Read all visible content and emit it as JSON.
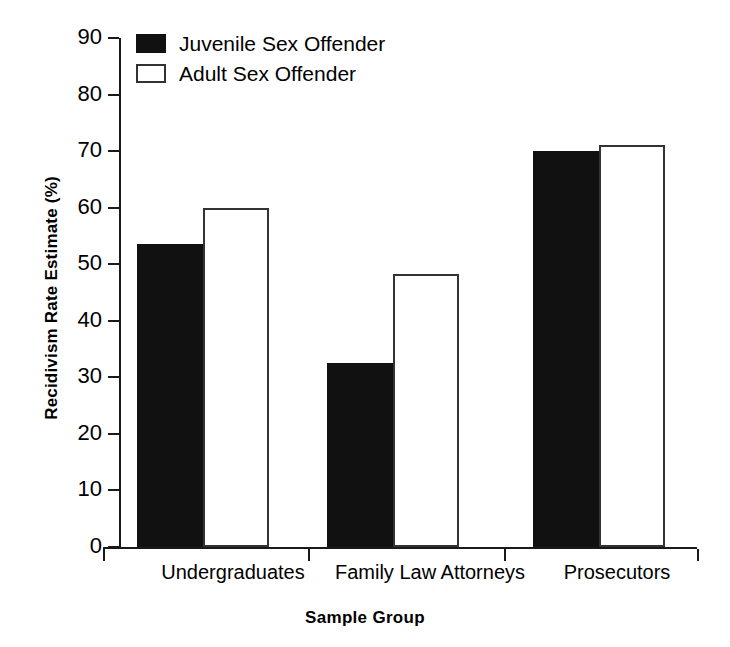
{
  "chart_data": {
    "type": "bar",
    "title": "",
    "xlabel": "Sample Group",
    "ylabel": "Recidivism Rate Estimate (%)",
    "categories": [
      "Undergraduates",
      "Family Law Attorneys",
      "Prosecutors"
    ],
    "series": [
      {
        "name": "Juvenile Sex Offender",
        "values": [
          53.5,
          32.5,
          70
        ],
        "fill": "#111111",
        "style": "filled"
      },
      {
        "name": "Adult Sex Offender",
        "values": [
          60,
          48.3,
          71
        ],
        "fill": "#ffffff",
        "style": "outlined"
      }
    ],
    "ylim": [
      0,
      90
    ],
    "yticks": [
      0,
      10,
      20,
      30,
      40,
      50,
      60,
      70,
      80,
      90
    ],
    "ytick_labels": [
      "0",
      "10",
      "20",
      "30",
      "40",
      "50",
      "60",
      "70",
      "80",
      "90"
    ],
    "grid": false,
    "legend_position": "top-left",
    "axis_color": "#1a1a1a"
  },
  "legend": {
    "items": [
      {
        "label": "Juvenile Sex Offender",
        "swatch": "filled-black-square"
      },
      {
        "label": "Adult Sex Offender",
        "swatch": "outlined-white-square"
      }
    ]
  }
}
